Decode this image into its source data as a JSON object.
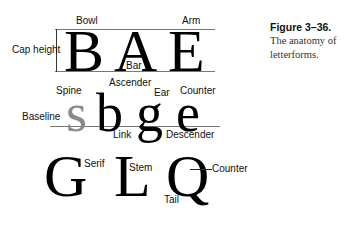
{
  "caption": {
    "title": "Figure 3–36.",
    "text": "The anatomy of letterforms."
  },
  "row1": {
    "letters": [
      "B",
      "A",
      "E"
    ],
    "labels": {
      "bowl": "Bowl",
      "arm": "Arm",
      "cap_height": "Cap height",
      "bar": "Bar"
    }
  },
  "row2": {
    "letters": [
      "s",
      "b",
      "g",
      "e"
    ],
    "labels": {
      "ascender": "Ascender",
      "spine": "Spine",
      "ear": "Ear",
      "counter": "Counter",
      "baseline": "Baseline",
      "link": "Link",
      "descender": "Descender"
    }
  },
  "row3": {
    "letters": [
      "G",
      "L",
      "Q"
    ],
    "labels": {
      "serif": "Serif",
      "stem": "Stem",
      "counter": "Counter",
      "tail": "Tail"
    }
  }
}
